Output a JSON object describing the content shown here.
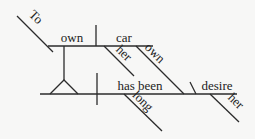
{
  "diagram": {
    "type": "sentence-diagram",
    "words": {
      "to": "To",
      "own_upper": "own",
      "car": "car",
      "her_upper": "her",
      "own_modifier": "own",
      "has_been": "has been",
      "desire": "desire",
      "long": "long",
      "her_lower": "her"
    },
    "colors": {
      "line": "#2b2b2b",
      "text": "#222222",
      "background": "#f7f7f6"
    }
  }
}
